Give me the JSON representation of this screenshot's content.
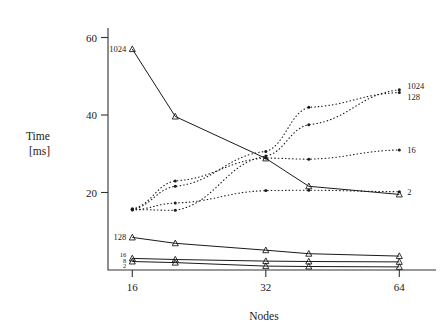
{
  "chart_data": {
    "type": "line",
    "title": "",
    "xlabel": "Nodes",
    "ylabel": "Time [ms]",
    "ylabel_line1": "Time",
    "ylabel_line2": "[ms]",
    "xscale": "log2",
    "xlim": [
      14.4,
      72
    ],
    "ylim": [
      0,
      66
    ],
    "xticks": [
      16,
      32,
      64
    ],
    "xtick_labels": [
      "16",
      "32",
      "64"
    ],
    "yticks": [
      20,
      40,
      60
    ],
    "ytick_labels": [
      "20",
      "40",
      "60"
    ],
    "grid": false,
    "legend": "inline-endpoint-labels",
    "x": [
      16,
      20,
      32,
      40,
      64
    ],
    "series": [
      {
        "name": "1024",
        "style": "solid",
        "marker": "triangle",
        "label_side": "left",
        "label": "1024",
        "values": [
          57.0,
          39.6,
          28.8,
          21.6,
          19.5
        ]
      },
      {
        "name": "128",
        "style": "solid",
        "marker": "triangle",
        "label_side": "left",
        "label": "128",
        "values": [
          8.4,
          6.9,
          5.1,
          4.2,
          3.6
        ]
      },
      {
        "name": "16",
        "style": "solid",
        "marker": "triangle",
        "label_side": "left",
        "label": "16",
        "values": [
          3.0,
          2.7,
          2.3,
          2.2,
          2.1
        ]
      },
      {
        "name": "2",
        "style": "solid",
        "marker": "triangle",
        "label_side": "left",
        "label": "2",
        "values": [
          2.2,
          1.9,
          1.0,
          0.9,
          0.8
        ]
      },
      {
        "name": "1024-dotted",
        "style": "dotted",
        "marker": "dot",
        "label_side": "right",
        "label": "1024",
        "values": [
          15.6,
          15.4,
          29.4,
          37.5,
          46.5
        ]
      },
      {
        "name": "128-dotted",
        "style": "dotted",
        "marker": "dot",
        "label_side": "right",
        "label": "128",
        "values": [
          15.7,
          21.6,
          30.6,
          42.0,
          45.8
        ]
      },
      {
        "name": "16-dotted",
        "style": "dotted",
        "marker": "dot",
        "label_side": "right",
        "label": "16",
        "values": [
          15.8,
          23.0,
          28.9,
          28.6,
          31.0
        ]
      },
      {
        "name": "2-dotted",
        "style": "dotted",
        "marker": "dot",
        "label_side": "right",
        "label": "2",
        "values": [
          15.5,
          17.3,
          20.5,
          20.6,
          20.2
        ]
      }
    ],
    "left_labels_stack": [
      "16",
      "8",
      "2"
    ],
    "right_label_group_top": [
      "1024",
      "128"
    ]
  },
  "axes": {
    "x_axis_label": "Nodes",
    "y_axis_label_top": "Time",
    "y_axis_label_bottom": "[ms]"
  }
}
